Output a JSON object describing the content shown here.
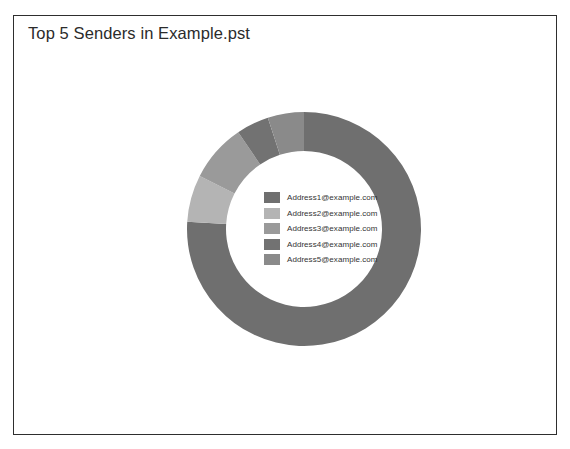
{
  "chart_data": {
    "type": "pie",
    "variant": "donut",
    "title": "Top 5 Senders in Example.pst",
    "xlabel": "",
    "ylabel": "",
    "grid": false,
    "legend_position": "center",
    "categories": [
      "Address1@example.com",
      "Address2@example.com",
      "Address3@example.com",
      "Address4@example.com",
      "Address5@example.com"
    ],
    "values": [
      76.0,
      6.5,
      8.0,
      4.5,
      5.0
    ],
    "units": "percent",
    "colors": [
      "#6f6f6f",
      "#b4b4b4",
      "#9a9a9a",
      "#727272",
      "#8a8a8a"
    ],
    "slices": [
      {
        "label": "Address1@example.com",
        "value": 76.0,
        "color": "#6f6f6f"
      },
      {
        "label": "Address2@example.com",
        "value": 6.5,
        "color": "#b4b4b4"
      },
      {
        "label": "Address3@example.com",
        "value": 8.0,
        "color": "#9a9a9a"
      },
      {
        "label": "Address4@example.com",
        "value": 4.5,
        "color": "#727272"
      },
      {
        "label": "Address5@example.com",
        "value": 5.0,
        "color": "#8a8a8a"
      }
    ]
  },
  "chart": {
    "title": "Top 5 Senders in Example.pst",
    "frame_color": "#2e2e2e",
    "background": "#ffffff"
  },
  "legend": {
    "items": [
      {
        "label": "Address1@example.com",
        "color": "#6f6f6f"
      },
      {
        "label": "Address2@example.com",
        "color": "#b4b4b4"
      },
      {
        "label": "Address3@example.com",
        "color": "#9a9a9a"
      },
      {
        "label": "Address4@example.com",
        "color": "#727272"
      },
      {
        "label": "Address5@example.com",
        "color": "#8a8a8a"
      }
    ]
  }
}
